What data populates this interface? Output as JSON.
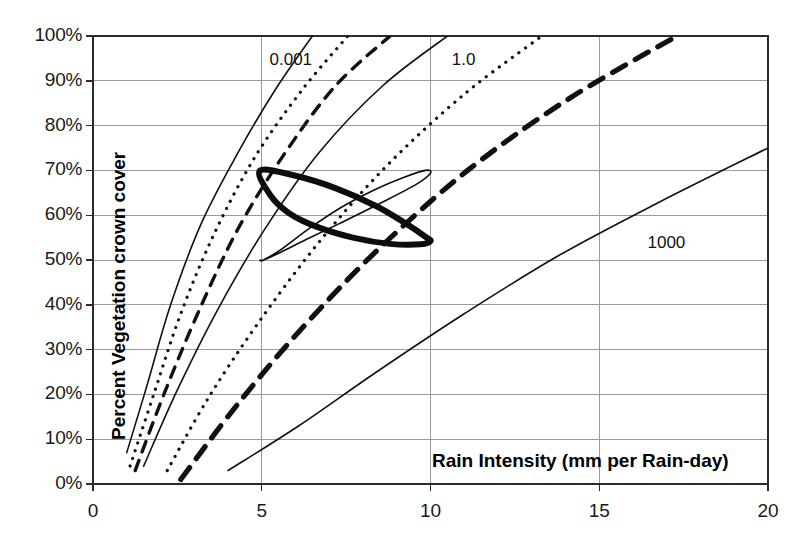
{
  "chart_data": {
    "type": "line",
    "title": "",
    "xlabel": "Rain Intensity (mm per Rain-day)",
    "ylabel": "Percent Vegetation crown cover",
    "xlim": [
      0,
      20
    ],
    "ylim": [
      0,
      100
    ],
    "xticks": [
      "0",
      "5",
      "10",
      "15",
      "20"
    ],
    "xtick_values": [
      0,
      5,
      10,
      15,
      20
    ],
    "yticks": [
      "0%",
      "10%",
      "20%",
      "30%",
      "40%",
      "50%",
      "60%",
      "70%",
      "80%",
      "90%",
      "100%"
    ],
    "ytick_values": [
      0,
      10,
      20,
      30,
      40,
      50,
      60,
      70,
      80,
      90,
      100
    ],
    "grid": "horizontal-and-vertical",
    "legend": "none",
    "annotations": [
      {
        "text": "0.001",
        "x": 6.0,
        "y": 94.5
      },
      {
        "text": "1.0",
        "x": 11.4,
        "y": 94.5
      },
      {
        "text": "1000",
        "x": 17.2,
        "y": 53.5
      }
    ],
    "series": [
      {
        "name": "contour-0.001",
        "style": "solid-thin",
        "label": "0.001",
        "points": [
          [
            1.0,
            7
          ],
          [
            1.6,
            22
          ],
          [
            2.3,
            40
          ],
          [
            3.2,
            58
          ],
          [
            4.3,
            74
          ],
          [
            5.4,
            88
          ],
          [
            6.5,
            100
          ]
        ]
      },
      {
        "name": "contour-b",
        "style": "dotted-thin",
        "label": "",
        "points": [
          [
            1.1,
            4
          ],
          [
            1.8,
            20
          ],
          [
            2.6,
            38
          ],
          [
            3.6,
            56
          ],
          [
            4.8,
            73
          ],
          [
            6.2,
            88
          ],
          [
            7.55,
            100
          ]
        ]
      },
      {
        "name": "contour-c",
        "style": "dashed-medium",
        "label": "",
        "points": [
          [
            1.25,
            3
          ],
          [
            2.1,
            20
          ],
          [
            3.1,
            38
          ],
          [
            4.3,
            57
          ],
          [
            5.7,
            74
          ],
          [
            7.2,
            89
          ],
          [
            8.8,
            100
          ]
        ]
      },
      {
        "name": "contour-1.0",
        "style": "solid-thin",
        "label": "1.0",
        "points": [
          [
            1.5,
            4
          ],
          [
            2.5,
            21
          ],
          [
            3.7,
            39
          ],
          [
            5.1,
            57
          ],
          [
            6.7,
            74
          ],
          [
            8.6,
            89
          ],
          [
            10.5,
            100
          ]
        ]
      },
      {
        "name": "contour-e",
        "style": "dotted-thin",
        "label": "",
        "points": [
          [
            2.2,
            3
          ],
          [
            3.4,
            19
          ],
          [
            4.9,
            36
          ],
          [
            6.7,
            54
          ],
          [
            8.7,
            71
          ],
          [
            11.0,
            87
          ],
          [
            13.3,
            100
          ]
        ]
      },
      {
        "name": "contour-f",
        "style": "dashed-heavy",
        "label": "",
        "points": [
          [
            2.6,
            1
          ],
          [
            4.2,
            17
          ],
          [
            6.1,
            34
          ],
          [
            8.4,
            52
          ],
          [
            11.1,
            70
          ],
          [
            14.1,
            86
          ],
          [
            17.3,
            100
          ]
        ]
      },
      {
        "name": "contour-1000",
        "style": "solid-thin",
        "label": "1000",
        "points": [
          [
            4.0,
            3
          ],
          [
            6.1,
            13
          ],
          [
            8.4,
            25
          ],
          [
            11.0,
            38
          ],
          [
            13.8,
            51
          ],
          [
            16.8,
            63
          ],
          [
            20.0,
            75
          ]
        ]
      }
    ],
    "closed_curves": [
      {
        "name": "envelope-bold",
        "style": "solid-bold",
        "points": [
          [
            4.95,
            70.0
          ],
          [
            6.0,
            68.8
          ],
          [
            7.2,
            66.0
          ],
          [
            8.4,
            62.0
          ],
          [
            9.3,
            58.0
          ],
          [
            9.85,
            55.2
          ],
          [
            10.0,
            54.2
          ],
          [
            9.7,
            53.5
          ],
          [
            8.8,
            53.6
          ],
          [
            7.7,
            55.0
          ],
          [
            6.6,
            57.5
          ],
          [
            5.8,
            60.5
          ],
          [
            5.25,
            64.5
          ],
          [
            4.95,
            70.0
          ]
        ]
      },
      {
        "name": "envelope-thin",
        "style": "solid-thin",
        "points": [
          [
            5.05,
            50.0
          ],
          [
            5.6,
            52.5
          ],
          [
            6.4,
            57.0
          ],
          [
            7.3,
            61.5
          ],
          [
            8.3,
            65.5
          ],
          [
            9.2,
            68.4
          ],
          [
            9.85,
            70.0
          ],
          [
            10.0,
            69.4
          ],
          [
            9.6,
            67.0
          ],
          [
            8.6,
            63.0
          ],
          [
            7.4,
            58.5
          ],
          [
            6.3,
            54.5
          ],
          [
            5.5,
            51.5
          ],
          [
            5.05,
            50.0
          ],
          [
            4.95,
            50.0
          ],
          [
            5.05,
            50.0
          ]
        ]
      }
    ]
  }
}
